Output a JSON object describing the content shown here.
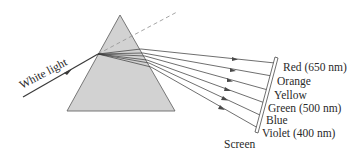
{
  "diagram": {
    "incident_label": "White light",
    "screen_label": "Screen",
    "colors": {
      "prism_fill": "#d2d2d2",
      "prism_stroke": "#6a6a6a",
      "ray": "#4a4a4a",
      "dashed": "#9a9a9a",
      "background": "#ffffff"
    },
    "spectrum": [
      {
        "name": "Red",
        "label": "Red (650 nm)"
      },
      {
        "name": "Orange",
        "label": "Orange"
      },
      {
        "name": "Yellow",
        "label": "Yellow"
      },
      {
        "name": "Green",
        "label": "Green (500 nm)"
      },
      {
        "name": "Blue",
        "label": "Blue"
      },
      {
        "name": "Violet",
        "label": "Violet (400 nm)"
      }
    ]
  }
}
